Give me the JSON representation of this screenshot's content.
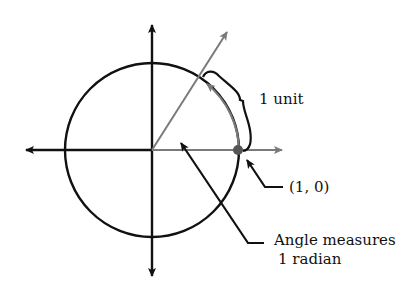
{
  "diagram": {
    "labels": {
      "arc_length": "1 unit",
      "point": "(1, 0)",
      "angle_line1": "Angle measures",
      "angle_line2": "1 radian"
    },
    "colors": {
      "ink": "#111111",
      "gray": "#7a7a7a",
      "point": "#555555"
    }
  }
}
